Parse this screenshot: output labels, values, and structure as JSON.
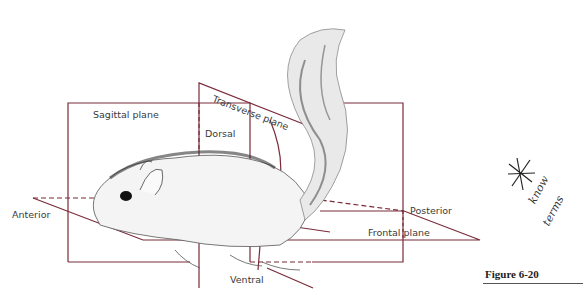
{
  "figure": {
    "caption": "Figure 6-20",
    "plane_color": "#7a2a3a"
  },
  "labels": {
    "sagittal_plane": "Sagittal plane",
    "transverse_plane": "Transverse plane",
    "dorsal": "Dorsal",
    "anterior": "Anterior",
    "posterior": "Posterior",
    "frontal_plane": "Frontal plane",
    "ventral": "Ventral"
  },
  "annotation": {
    "mark": "asterisk",
    "handwritten_line1": "know",
    "handwritten_line2": "terms"
  }
}
